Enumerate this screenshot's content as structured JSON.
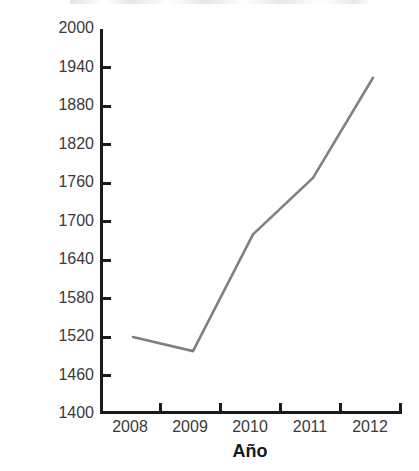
{
  "chart_data": {
    "type": "line",
    "title": "",
    "xlabel": "Año",
    "ylabel": "Miles de millones de dólares",
    "categories": [
      "2008",
      "2009",
      "2010",
      "2011",
      "2012"
    ],
    "x": [
      2008,
      2009,
      2010,
      2011,
      2012
    ],
    "values": [
      1520,
      1498,
      1680,
      1768,
      1924
    ],
    "series": [
      {
        "name": "",
        "values": [
          1520,
          1498,
          1680,
          1768,
          1924
        ]
      }
    ],
    "ylim": [
      1400,
      2000
    ],
    "ytick_step": 60,
    "yticks": [
      1400,
      1460,
      1520,
      1580,
      1640,
      1700,
      1760,
      1820,
      1880,
      1940,
      2000
    ],
    "ytick_labels": [
      "1400",
      "1460",
      "1520",
      "1580",
      "1640",
      "1700",
      "1760",
      "1820",
      "1880",
      "1940",
      "2000"
    ],
    "xtick_labels": [
      "2008",
      "2009",
      "2010",
      "2011",
      "2012"
    ],
    "grid": false,
    "legend": null,
    "legend_position": "none",
    "line_color": "#808080",
    "axis_color": "#1a1a1a",
    "background": "#ffffff",
    "markers": false,
    "annotations": []
  },
  "axes": {
    "y_title": "Miles de millones de dólares",
    "x_title": "Año"
  },
  "title_sliver": {
    "text": ""
  }
}
